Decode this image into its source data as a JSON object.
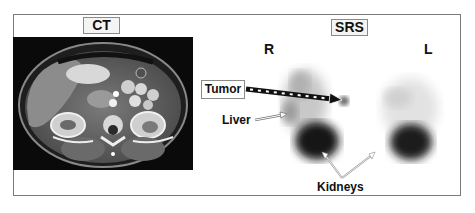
{
  "figure": {
    "panels": [
      {
        "id": "ct",
        "title": "CT",
        "description": "Axial contrast-enhanced CT slice of upper abdomen showing liver, kidneys, spine"
      },
      {
        "id": "srs",
        "title": "SRS",
        "description": "Somatostatin receptor scintigraphy, grayscale planar image"
      }
    ],
    "orientation": {
      "right": "R",
      "left": "L"
    },
    "annotations": {
      "tumor": "Tumor",
      "liver": "Liver",
      "kidneys": "Kidneys"
    },
    "colors": {
      "frame_border": "#7a7a7a",
      "label_bg": "#f4f4f4",
      "ct_background": "#0a0a0a",
      "uptake_dark": "#111111"
    }
  }
}
